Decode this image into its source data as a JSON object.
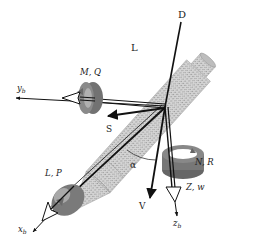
{
  "diagram": {
    "colors": {
      "background": "#ffffff",
      "body_fill": "#c8c8c8",
      "lines": "#111111",
      "rings": "#6e6e6e",
      "ring_dark": "#5a5a5a"
    },
    "labels": {
      "drag": "D",
      "lift": "L",
      "side_force": "S",
      "velocity": "V",
      "angle_of_attack": "α",
      "x_axis": "x",
      "x_axis_sub": "b",
      "y_axis": "y",
      "y_axis_sub": "b",
      "z_axis": "z",
      "z_axis_sub": "b",
      "pitch_moment": "M, Q",
      "roll_moment": "L, P",
      "yaw_moment": "N, R",
      "normal_force": "Z, w"
    }
  }
}
